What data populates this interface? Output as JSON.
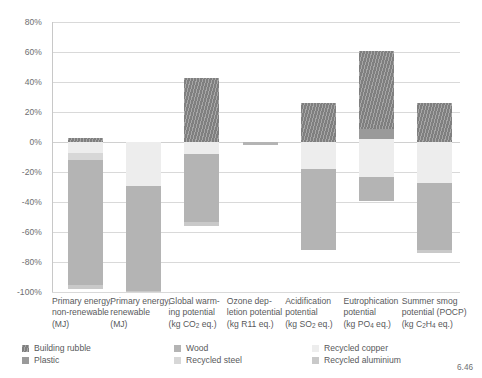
{
  "chart_data": {
    "type": "bar",
    "title": "",
    "subtitle": "",
    "xlabel": "",
    "ylabel": "",
    "ylim": [
      -100,
      80
    ],
    "ytick_labels": [
      "80%",
      "60%",
      "40%",
      "20%",
      "0%",
      "-20%",
      "-40%",
      "-60%",
      "-80%",
      "-100%"
    ],
    "ytick_values": [
      80,
      60,
      40,
      20,
      0,
      -20,
      -40,
      -60,
      -80,
      -100
    ],
    "grid": true,
    "legend_position": "bottom",
    "stacked": true,
    "categories": [
      "Primary energy, non-renewable (MJ)",
      "Primary energy, renewable (MJ)",
      "Global warming potential (kg CO2 eq.)",
      "Ozone depletion potential (kg R11 eq.)",
      "Acidification potential (kg SO2 eq.)",
      "Eutrophication potential (kg PO4 eq.)",
      "Summer smog potential (POCP) (kg C2H4 eq.)"
    ],
    "category_lines": [
      [
        "Primary energy,",
        "non-renewable",
        "(MJ)"
      ],
      [
        "Primary energy,",
        "renewable",
        "(MJ)"
      ],
      [
        "Global warm-",
        "ing potential",
        "(kg CO2 eq.)"
      ],
      [
        "Ozone dep-",
        "letion potential",
        "(kg R11 eq.)"
      ],
      [
        "Acidification",
        "potential",
        "(kg SO2 eq.)"
      ],
      [
        "Eutrophication",
        "potential",
        "(kg PO4 eq.)"
      ],
      [
        "Summer smog",
        "potential (POCP)",
        "(kg C2H4 eq.)"
      ]
    ],
    "series": [
      {
        "name": "Building rubble",
        "color": "#7f7f7f",
        "values": [
          3,
          0,
          43,
          0,
          26,
          52,
          26
        ]
      },
      {
        "name": "Plastic",
        "color": "#9a9a9a",
        "values": [
          0,
          0,
          0,
          0,
          0,
          7,
          0
        ]
      },
      {
        "name": "Wood",
        "color": "#b4b4b4",
        "values": [
          -83,
          -70,
          -45,
          -2,
          -54,
          -16,
          -45
        ]
      },
      {
        "name": "Recycled steel",
        "color": "#d7d7d7",
        "values": [
          -5,
          0,
          0,
          0,
          0,
          0,
          0
        ]
      },
      {
        "name": "Recycled copper",
        "color": "#ededed",
        "values": [
          -7,
          -29,
          -8,
          0,
          -18,
          -25,
          -27
        ]
      },
      {
        "name": "Recycled aluminium",
        "color": "#c9c9c9",
        "values": [
          -3,
          -1,
          -3,
          0,
          0,
          0,
          -2
        ]
      }
    ],
    "bar_segments": [
      {
        "category": "Primary energy, non-renewable (MJ)",
        "segments": [
          {
            "series": "Building rubble",
            "from": 0,
            "to": 3
          },
          {
            "series": "Recycled copper",
            "from": 0,
            "to": -7
          },
          {
            "series": "Recycled steel",
            "from": -7,
            "to": -12
          },
          {
            "series": "Wood",
            "from": -12,
            "to": -95
          },
          {
            "series": "Recycled aluminium",
            "from": -95,
            "to": -98
          }
        ]
      },
      {
        "category": "Primary energy, renewable (MJ)",
        "segments": [
          {
            "series": "Recycled copper",
            "from": 0,
            "to": -29
          },
          {
            "series": "Wood",
            "from": -29,
            "to": -99
          },
          {
            "series": "Recycled aluminium",
            "from": -99,
            "to": -100
          }
        ]
      },
      {
        "category": "Global warming potential (kg CO2 eq.)",
        "segments": [
          {
            "series": "Building rubble",
            "from": 0,
            "to": 43
          },
          {
            "series": "Recycled copper",
            "from": 0,
            "to": -8
          },
          {
            "series": "Wood",
            "from": -8,
            "to": -53
          },
          {
            "series": "Recycled aluminium",
            "from": -53,
            "to": -56
          }
        ]
      },
      {
        "category": "Ozone depletion potential (kg R11 eq.)",
        "segments": [
          {
            "series": "Wood",
            "from": 0,
            "to": -2
          }
        ]
      },
      {
        "category": "Acidification potential (kg SO2 eq.)",
        "segments": [
          {
            "series": "Building rubble",
            "from": 0,
            "to": 26
          },
          {
            "series": "Recycled copper",
            "from": 0,
            "to": -18
          },
          {
            "series": "Wood",
            "from": -18,
            "to": -72
          }
        ]
      },
      {
        "category": "Eutrophication potential (kg PO4 eq.)",
        "segments": [
          {
            "series": "Building rubble",
            "from": 9,
            "to": 61
          },
          {
            "series": "Plastic",
            "from": 2,
            "to": 9
          },
          {
            "series": "Recycled copper",
            "from": 2,
            "to": -23
          },
          {
            "series": "Wood",
            "from": -23,
            "to": -39
          }
        ]
      },
      {
        "category": "Summer smog potential (POCP) (kg C2H4 eq.)",
        "segments": [
          {
            "series": "Building rubble",
            "from": 0,
            "to": 26
          },
          {
            "series": "Recycled copper",
            "from": 0,
            "to": -27
          },
          {
            "series": "Wood",
            "from": -27,
            "to": -72
          },
          {
            "series": "Recycled aluminium",
            "from": -72,
            "to": -74
          }
        ]
      }
    ],
    "legend": [
      {
        "label": "Building rubble",
        "color": "#7f7f7f"
      },
      {
        "label": "Plastic",
        "color": "#9a9a9a"
      },
      {
        "label": "Wood",
        "color": "#b4b4b4"
      },
      {
        "label": "Recycled steel",
        "color": "#d7d7d7"
      },
      {
        "label": "Recycled copper",
        "color": "#ededed"
      },
      {
        "label": "Recycled aluminium",
        "color": "#c9c9c9"
      }
    ]
  },
  "figure": {
    "page_number": "6.46"
  }
}
